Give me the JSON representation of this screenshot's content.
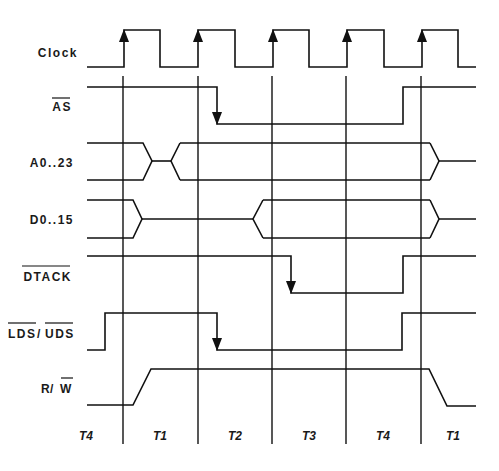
{
  "diagram": {
    "type": "timing-diagram",
    "signals": [
      {
        "label": "Clock",
        "overbar": false
      },
      {
        "label": "AS",
        "overbar": true
      },
      {
        "label": "A0..23",
        "overbar": false
      },
      {
        "label": "D0..15",
        "overbar": false
      },
      {
        "label": "DTACK",
        "overbar": true
      },
      {
        "label_part1": "LDS",
        "separator": "/",
        "label_part2": "UDS",
        "overbar": true
      },
      {
        "label_part1": "R",
        "separator": " / ",
        "label_part2": "W",
        "overbar_part2": true
      }
    ],
    "states": [
      "T4",
      "T1",
      "T2",
      "T3",
      "T4",
      "T1"
    ],
    "colors": {
      "line": "#111111",
      "background": "#ffffff"
    }
  }
}
